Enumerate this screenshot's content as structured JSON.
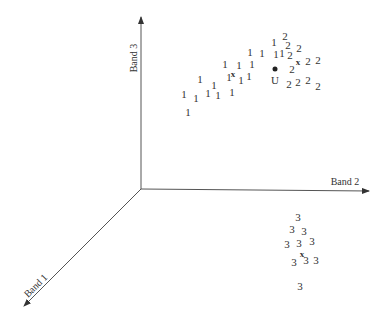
{
  "diagram": {
    "type": "3d-feature-space-scatter",
    "axes": [
      {
        "id": "band1",
        "label": "Band 1"
      },
      {
        "id": "band2",
        "label": "Band 2"
      },
      {
        "id": "band3",
        "label": "Band 3"
      }
    ],
    "unknown_point": {
      "label": "U",
      "x": 275,
      "y": 69
    },
    "clusters": [
      {
        "class": "1",
        "centroid": {
          "x": 233,
          "y": 74
        },
        "points": [
          [
            274,
            46
          ],
          [
            262,
            57
          ],
          [
            276,
            58
          ],
          [
            282,
            57
          ],
          [
            250,
            56
          ],
          [
            225,
            68
          ],
          [
            239,
            69
          ],
          [
            252,
            68
          ],
          [
            200,
            83
          ],
          [
            229,
            81
          ],
          [
            241,
            84
          ],
          [
            249,
            80
          ],
          [
            214,
            89
          ],
          [
            184,
            98
          ],
          [
            196,
            102
          ],
          [
            208,
            97
          ],
          [
            218,
            99
          ],
          [
            232,
            96
          ],
          [
            188,
            116
          ]
        ]
      },
      {
        "class": "2",
        "centroid": {
          "x": 298,
          "y": 62
        },
        "points": [
          [
            285,
            40
          ],
          [
            288,
            49
          ],
          [
            290,
            59
          ],
          [
            299,
            52
          ],
          [
            308,
            65
          ],
          [
            318,
            64
          ],
          [
            292,
            73
          ],
          [
            289,
            88
          ],
          [
            298,
            86
          ],
          [
            308,
            84
          ],
          [
            318,
            90
          ]
        ]
      },
      {
        "class": "3",
        "centroid": {
          "x": 302,
          "y": 254
        },
        "points": [
          [
            298,
            221
          ],
          [
            292,
            233
          ],
          [
            304,
            235
          ],
          [
            287,
            248
          ],
          [
            299,
            247
          ],
          [
            312,
            245
          ],
          [
            294,
            266
          ],
          [
            306,
            264
          ],
          [
            316,
            264
          ],
          [
            300,
            290
          ]
        ]
      }
    ],
    "centroid_marker": "x",
    "unknown_marker": "filled-dot",
    "colors": {
      "ink": "#333333",
      "background": "#ffffff"
    }
  }
}
